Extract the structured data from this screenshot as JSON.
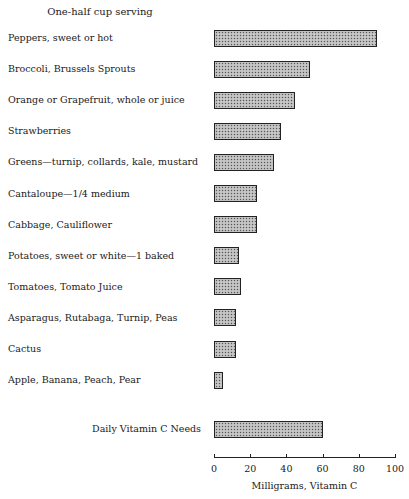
{
  "chart_data": {
    "type": "bar",
    "orientation": "horizontal",
    "title": "",
    "subtitle": "One-half cup serving",
    "xlabel": "Milligrams, Vitamin C",
    "ylabel": "",
    "xlim": [
      0,
      100
    ],
    "xticks": [
      0,
      20,
      40,
      60,
      80,
      100
    ],
    "grid": false,
    "categories": [
      "Peppers, sweet or hot",
      "Broccoli, Brussels Sprouts",
      "Orange or Grapefruit, whole or juice",
      "Strawberries",
      "Greens—turnip, collards, kale, mustard",
      "Cantaloupe—1/4 medium",
      "Cabbage, Cauliflower",
      "Potatoes, sweet or white—1 baked",
      "Tomatoes, Tomato Juice",
      "Asparagus, Rutabaga, Turnip, Peas",
      "Cactus",
      "Apple, Banana, Peach, Pear"
    ],
    "values": [
      90,
      53,
      45,
      37,
      33,
      24,
      24,
      14,
      15,
      12,
      12,
      5
    ],
    "reference": {
      "label": "Daily Vitamin C Needs",
      "value": 60
    }
  },
  "colors": {
    "bar_fill": "#b8b8b8",
    "bar_border": "#222222",
    "text": "#1a1a1a"
  }
}
